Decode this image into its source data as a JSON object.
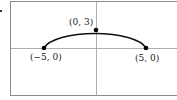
{
  "figure": {
    "type": "semi-ellipse graph",
    "points": [
      {
        "label": "(0, 3)",
        "x": 0,
        "y": 3
      },
      {
        "label": "(−5, 0)",
        "x": -5,
        "y": 0
      },
      {
        "label": "(5, 0)",
        "x": 5,
        "y": 0
      }
    ],
    "colors": {
      "curve": "#111111",
      "axes": "#999999",
      "frame": "#888888",
      "background": "#ffffff"
    }
  }
}
